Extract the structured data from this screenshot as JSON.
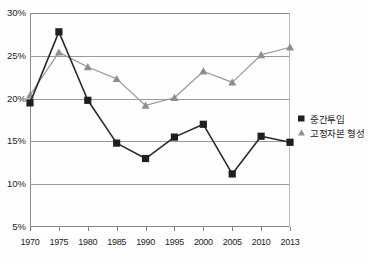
{
  "chart_data": {
    "type": "line",
    "title": "",
    "subtitle": "",
    "xlabel": "",
    "ylabel": "",
    "categories": [
      "1970",
      "1975",
      "1980",
      "1985",
      "1990",
      "1995",
      "2000",
      "2005",
      "2010",
      "2013"
    ],
    "ylim": [
      5,
      30
    ],
    "ytick_labels": [
      "5%",
      "10%",
      "15%",
      "20%",
      "25%",
      "30%"
    ],
    "ytick_values": [
      5,
      10,
      15,
      20,
      25,
      30
    ],
    "ytick_suffix": "%",
    "grid": true,
    "grid_axis": "y",
    "legend_position": "right",
    "series": [
      {
        "name": "중간투입",
        "marker": "square",
        "color": "#1f1f1f",
        "line_color": "#2b2b2b",
        "values": [
          19.5,
          27.8,
          19.8,
          14.8,
          13.0,
          15.5,
          17.0,
          11.2,
          15.6,
          14.9
        ]
      },
      {
        "name": "고정자본 형성",
        "marker": "triangle",
        "color": "#8e8e8e",
        "line_color": "#9a9a9a",
        "values": [
          20.4,
          25.4,
          23.7,
          22.3,
          19.2,
          20.1,
          23.2,
          21.9,
          25.1,
          26.0
        ]
      }
    ]
  },
  "legend": {
    "items": [
      {
        "label": "중간투입",
        "marker": "square-marker-icon"
      },
      {
        "label": "고정자본 형성",
        "marker": "triangle-marker-icon"
      }
    ]
  },
  "colors": {
    "series_one": "#1f1f1f",
    "series_two": "#8e8e8e",
    "gridline": "#9a9a9a",
    "axis": "#8a8a8a",
    "background": "#fefefe",
    "text": "#1d1d1d"
  }
}
